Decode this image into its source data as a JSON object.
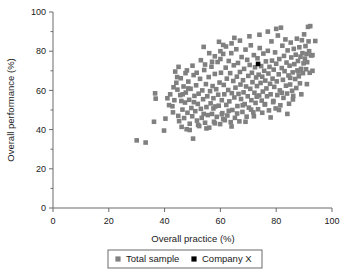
{
  "chart_data": {
    "type": "scatter",
    "title": "",
    "xlabel": "Overall practice (%)",
    "ylabel": "Overall performance (%)",
    "xlim": [
      0,
      100
    ],
    "ylim": [
      0,
      100
    ],
    "xticks": [
      0,
      20,
      40,
      60,
      80,
      100
    ],
    "yticks": [
      0,
      20,
      40,
      60,
      80,
      100
    ],
    "xtick_labels": [
      "0",
      "20",
      "40",
      "60",
      "80",
      "100"
    ],
    "ytick_labels": [
      "0",
      "20",
      "40",
      "60",
      "80",
      "100"
    ],
    "minor_tick_step": 10,
    "grid": false,
    "legend_position": "bottom",
    "marker": "square",
    "series": [
      {
        "name": "Total sample",
        "color": "#808080",
        "marker": "square",
        "points": [
          [
            30.0,
            34.5
          ],
          [
            33.2,
            33.4
          ],
          [
            36.2,
            44.0
          ],
          [
            36.6,
            58.5
          ],
          [
            36.8,
            55.8
          ],
          [
            39.8,
            39.5
          ],
          [
            40.3,
            45.6
          ],
          [
            41.6,
            52.5
          ],
          [
            42.8,
            51.9
          ],
          [
            43.5,
            55.0
          ],
          [
            43.8,
            69.6
          ],
          [
            44.2,
            63.9
          ],
          [
            44.6,
            60.4
          ],
          [
            44.9,
            47.0
          ],
          [
            45.2,
            44.3
          ],
          [
            45.6,
            57.6
          ],
          [
            45.8,
            66.2
          ],
          [
            46.1,
            41.4
          ],
          [
            46.4,
            50.2
          ],
          [
            46.8,
            62.0
          ],
          [
            47.0,
            45.9
          ],
          [
            47.3,
            53.8
          ],
          [
            47.6,
            58.9
          ],
          [
            47.9,
            40.2
          ],
          [
            48.2,
            48.6
          ],
          [
            48.5,
            64.5
          ],
          [
            48.8,
            55.2
          ],
          [
            49.0,
            43.0
          ],
          [
            49.3,
            60.8
          ],
          [
            49.6,
            51.0
          ],
          [
            49.9,
            46.8
          ],
          [
            50.2,
            35.4
          ],
          [
            50.4,
            67.8
          ],
          [
            50.7,
            57.2
          ],
          [
            51.0,
            49.4
          ],
          [
            51.3,
            62.6
          ],
          [
            51.6,
            44.6
          ],
          [
            51.9,
            53.1
          ],
          [
            52.2,
            58.3
          ],
          [
            52.4,
            41.8
          ],
          [
            52.7,
            65.9
          ],
          [
            53.0,
            50.6
          ],
          [
            53.3,
            46.0
          ],
          [
            53.5,
            60.0
          ],
          [
            53.8,
            55.5
          ],
          [
            54.0,
            82.2
          ],
          [
            54.2,
            70.4
          ],
          [
            54.5,
            43.5
          ],
          [
            54.8,
            63.2
          ],
          [
            55.0,
            51.5
          ],
          [
            55.3,
            57.0
          ],
          [
            55.5,
            47.4
          ],
          [
            55.8,
            66.8
          ],
          [
            56.0,
            41.0
          ],
          [
            56.3,
            59.6
          ],
          [
            56.5,
            53.4
          ],
          [
            56.8,
            72.1
          ],
          [
            57.0,
            48.0
          ],
          [
            57.2,
            62.2
          ],
          [
            57.5,
            56.0
          ],
          [
            57.7,
            44.0
          ],
          [
            58.0,
            68.4
          ],
          [
            58.2,
            51.8
          ],
          [
            58.5,
            60.6
          ],
          [
            58.7,
            46.5
          ],
          [
            59.0,
            74.5
          ],
          [
            59.2,
            57.8
          ],
          [
            59.4,
            52.2
          ],
          [
            59.7,
            64.0
          ],
          [
            59.9,
            42.8
          ],
          [
            60.0,
            80.0
          ],
          [
            60.2,
            69.0
          ],
          [
            60.5,
            55.0
          ],
          [
            60.7,
            48.4
          ],
          [
            61.0,
            83.2
          ],
          [
            61.2,
            62.8
          ],
          [
            61.4,
            58.0
          ],
          [
            61.6,
            44.8
          ],
          [
            61.9,
            71.6
          ],
          [
            62.1,
            52.6
          ],
          [
            62.3,
            66.0
          ],
          [
            62.5,
            47.2
          ],
          [
            62.8,
            60.2
          ],
          [
            63.0,
            75.0
          ],
          [
            63.2,
            54.4
          ],
          [
            63.5,
            68.8
          ],
          [
            63.7,
            43.8
          ],
          [
            63.9,
            79.0
          ],
          [
            64.1,
            58.6
          ],
          [
            64.3,
            50.0
          ],
          [
            64.6,
            64.8
          ],
          [
            64.8,
            72.8
          ],
          [
            65.0,
            56.4
          ],
          [
            65.2,
            46.0
          ],
          [
            65.4,
            61.4
          ],
          [
            65.7,
            81.0
          ],
          [
            65.9,
            67.0
          ],
          [
            66.1,
            52.0
          ],
          [
            66.3,
            74.0
          ],
          [
            66.5,
            58.2
          ],
          [
            66.8,
            44.2
          ],
          [
            67.0,
            69.4
          ],
          [
            67.2,
            63.0
          ],
          [
            67.4,
            55.6
          ],
          [
            67.6,
            77.0
          ],
          [
            67.9,
            49.0
          ],
          [
            68.1,
            65.2
          ],
          [
            68.3,
            59.0
          ],
          [
            68.5,
            71.0
          ],
          [
            68.7,
            53.0
          ],
          [
            69.0,
            80.8
          ],
          [
            69.2,
            62.0
          ],
          [
            69.4,
            46.6
          ],
          [
            69.6,
            75.6
          ],
          [
            69.8,
            57.0
          ],
          [
            70.0,
            67.4
          ],
          [
            70.2,
            51.2
          ],
          [
            70.5,
            73.0
          ],
          [
            70.7,
            60.8
          ],
          [
            70.9,
            83.0
          ],
          [
            71.1,
            55.0
          ],
          [
            71.3,
            69.0
          ],
          [
            71.5,
            64.2
          ],
          [
            71.8,
            48.8
          ],
          [
            72.0,
            78.0
          ],
          [
            72.2,
            58.8
          ],
          [
            72.4,
            71.8
          ],
          [
            72.6,
            53.6
          ],
          [
            72.8,
            66.6
          ],
          [
            73.1,
            62.2
          ],
          [
            73.3,
            76.4
          ],
          [
            73.5,
            50.4
          ],
          [
            73.7,
            68.0
          ],
          [
            73.9,
            57.4
          ],
          [
            74.1,
            81.6
          ],
          [
            74.4,
            63.8
          ],
          [
            74.6,
            72.4
          ],
          [
            74.8,
            54.8
          ],
          [
            75.0,
            67.0
          ],
          [
            75.2,
            59.4
          ],
          [
            75.4,
            78.8
          ],
          [
            75.7,
            70.0
          ],
          [
            75.9,
            52.8
          ],
          [
            76.1,
            65.0
          ],
          [
            76.3,
            74.8
          ],
          [
            76.5,
            61.0
          ],
          [
            76.7,
            57.0
          ],
          [
            77.0,
            80.2
          ],
          [
            77.2,
            68.6
          ],
          [
            77.4,
            49.8
          ],
          [
            77.6,
            72.0
          ],
          [
            77.8,
            63.4
          ],
          [
            78.0,
            58.0
          ],
          [
            78.3,
            85.0
          ],
          [
            78.5,
            75.2
          ],
          [
            78.7,
            66.0
          ],
          [
            78.9,
            54.0
          ],
          [
            79.1,
            70.6
          ],
          [
            79.3,
            61.8
          ],
          [
            79.6,
            79.4
          ],
          [
            79.8,
            50.8
          ],
          [
            80.0,
            73.6
          ],
          [
            80.2,
            64.6
          ],
          [
            80.4,
            57.6
          ],
          [
            80.6,
            88.0
          ],
          [
            80.9,
            68.2
          ],
          [
            81.1,
            76.0
          ],
          [
            81.3,
            60.0
          ],
          [
            81.5,
            52.4
          ],
          [
            81.7,
            92.0
          ],
          [
            82.0,
            71.4
          ],
          [
            82.2,
            82.8
          ],
          [
            82.4,
            65.4
          ],
          [
            82.6,
            56.2
          ],
          [
            82.8,
            77.6
          ],
          [
            83.0,
            69.8
          ],
          [
            83.3,
            86.0
          ],
          [
            83.5,
            62.4
          ],
          [
            83.7,
            74.2
          ],
          [
            83.9,
            58.4
          ],
          [
            84.1,
            80.4
          ],
          [
            84.4,
            67.6
          ],
          [
            84.6,
            53.2
          ],
          [
            84.8,
            72.6
          ],
          [
            85.0,
            63.0
          ],
          [
            85.2,
            84.4
          ],
          [
            85.4,
            76.8
          ],
          [
            85.7,
            59.8
          ],
          [
            85.9,
            69.2
          ],
          [
            86.1,
            57.2
          ],
          [
            86.3,
            81.2
          ],
          [
            86.5,
            73.4
          ],
          [
            86.8,
            65.8
          ],
          [
            87.0,
            78.2
          ],
          [
            87.2,
            61.2
          ],
          [
            87.4,
            86.4
          ],
          [
            87.6,
            70.2
          ],
          [
            87.8,
            75.0
          ],
          [
            88.1,
            67.2
          ],
          [
            88.3,
            82.0
          ],
          [
            88.5,
            63.6
          ],
          [
            88.7,
            77.2
          ],
          [
            88.9,
            71.0
          ],
          [
            89.2,
            85.6
          ],
          [
            89.4,
            79.0
          ],
          [
            89.6,
            68.8
          ],
          [
            89.8,
            73.8
          ],
          [
            90.0,
            88.6
          ],
          [
            90.3,
            76.2
          ],
          [
            90.5,
            82.6
          ],
          [
            90.7,
            70.8
          ],
          [
            90.9,
            78.6
          ],
          [
            91.1,
            74.4
          ],
          [
            91.4,
            92.4
          ],
          [
            91.6,
            85.0
          ],
          [
            91.8,
            80.0
          ],
          [
            92.0,
            69.0
          ],
          [
            92.2,
            92.8
          ],
          [
            92.5,
            77.8
          ],
          [
            93.0,
            78.0
          ],
          [
            94.0,
            85.2
          ],
          [
            59.5,
            84.8
          ],
          [
            62.0,
            82.4
          ],
          [
            56.0,
            79.0
          ],
          [
            53.0,
            75.4
          ],
          [
            65.0,
            86.8
          ],
          [
            70.4,
            87.6
          ],
          [
            74.0,
            88.4
          ],
          [
            77.0,
            90.0
          ],
          [
            80.0,
            91.4
          ],
          [
            58.0,
            77.4
          ],
          [
            61.0,
            78.6
          ],
          [
            64.0,
            84.0
          ],
          [
            67.0,
            85.4
          ],
          [
            50.0,
            72.6
          ],
          [
            47.5,
            68.8
          ],
          [
            45.0,
            72.0
          ],
          [
            48.0,
            70.2
          ],
          [
            51.5,
            69.0
          ],
          [
            54.5,
            73.2
          ],
          [
            57.0,
            74.6
          ],
          [
            60.0,
            76.0
          ],
          [
            42.0,
            58.0
          ],
          [
            43.0,
            48.8
          ],
          [
            46.0,
            54.6
          ],
          [
            49.0,
            39.8
          ],
          [
            52.0,
            42.4
          ],
          [
            55.0,
            40.6
          ],
          [
            58.0,
            43.2
          ],
          [
            61.0,
            45.4
          ],
          [
            64.0,
            41.6
          ],
          [
            66.0,
            48.2
          ],
          [
            69.0,
            44.0
          ],
          [
            72.0,
            46.8
          ],
          [
            75.0,
            48.6
          ],
          [
            78.0,
            46.2
          ],
          [
            81.0,
            50.0
          ],
          [
            84.0,
            48.0
          ],
          [
            86.0,
            55.4
          ],
          [
            89.0,
            58.0
          ],
          [
            91.0,
            63.2
          ],
          [
            93.0,
            70.0
          ],
          [
            88.0,
            69.6
          ],
          [
            85.0,
            66.4
          ],
          [
            82.0,
            58.8
          ],
          [
            79.0,
            54.6
          ],
          [
            76.0,
            53.0
          ],
          [
            73.0,
            56.8
          ],
          [
            71.0,
            50.2
          ],
          [
            68.0,
            52.4
          ],
          [
            63.0,
            49.6
          ],
          [
            60.5,
            47.8
          ],
          [
            57.5,
            50.8
          ],
          [
            54.0,
            48.0
          ],
          [
            50.5,
            54.0
          ],
          [
            48.5,
            61.0
          ],
          [
            46.5,
            58.0
          ],
          [
            44.5,
            66.8
          ],
          [
            43.2,
            61.6
          ],
          [
            41.0,
            56.0
          ]
        ]
      },
      {
        "name": "Company X",
        "color": "#000000",
        "marker": "square",
        "points": [
          [
            73.5,
            73.5
          ]
        ]
      }
    ]
  },
  "legend": {
    "entries": [
      {
        "label": "Total sample",
        "color": "#808080"
      },
      {
        "label": "Company X",
        "color": "#000000"
      }
    ]
  },
  "colors": {
    "sample_marker": "#808080",
    "company_marker": "#000000",
    "axis": "#6b6b6b",
    "text": "#1a1a1a",
    "background": "#ffffff"
  }
}
